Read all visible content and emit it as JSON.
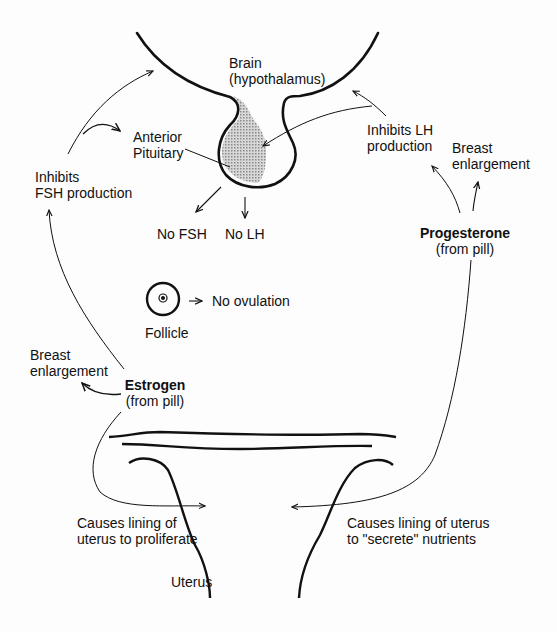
{
  "diagram": {
    "type": "hormonal-pathway",
    "brain": {
      "line1": "Brain",
      "line2": "(hypothalamus)"
    },
    "pituitary": {
      "line1": "Anterior",
      "line2": "Pituitary"
    },
    "inhibits_fsh": {
      "line1": "Inhibits",
      "line2": "FSH production"
    },
    "inhibits_lh": {
      "line1": "Inhibits LH",
      "line2": "production"
    },
    "breast_right": {
      "line1": "Breast",
      "line2": "enlargement"
    },
    "breast_left": {
      "line1": "Breast",
      "line2": "enlargement"
    },
    "no_fsh": "No FSH",
    "no_lh": "No LH",
    "follicle": "Follicle",
    "no_ovulation": "No ovulation",
    "estrogen": {
      "name": "Estrogen",
      "source": "(from pill)"
    },
    "progesterone": {
      "name": "Progesterone",
      "source": "(from pill)"
    },
    "uterus_left": {
      "line1": "Causes lining of",
      "line2": "uterus to proliferate"
    },
    "uterus_right": {
      "line1": "Causes lining of uterus",
      "line2": "to \"secrete\" nutrients"
    },
    "uterus": "Uterus",
    "colors": {
      "ink": "#111111",
      "shading": "#b5b5b5",
      "background": "#fdfdfd"
    }
  }
}
